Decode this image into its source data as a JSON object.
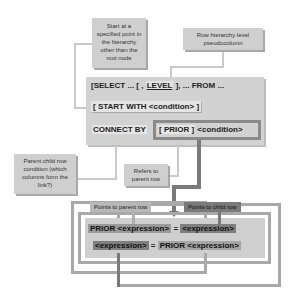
{
  "notes": {
    "start_point": "Start at a specified point in the hierarchy other than the root node",
    "level": "Row hierarchy level pseudocolumn",
    "parent_child": "Parent child row condition (which columns form the link?)",
    "refers_parent": "Refers to parent row"
  },
  "syntax": {
    "line1_pre": "[SELECT ... [ , ",
    "line1_level": "LEVEL",
    "line1_post": " ], ... FROM ...",
    "line2": "[ START WITH <condition> ]",
    "line3_connect": "CONNECT BY",
    "line3_prior": "[ PRIOR ]",
    "line3_cond": "<condition>"
  },
  "bottom": {
    "tag_parent": "Points to parent row",
    "tag_child": "Points to child row",
    "expr1_prior": "PRIOR <expression>",
    "expr1_eq": " = ",
    "expr1_rhs": "<expression>",
    "expr2_lhs": "<expression>",
    "expr2_eq": " = ",
    "expr2_prior": "PRIOR <expression>"
  }
}
